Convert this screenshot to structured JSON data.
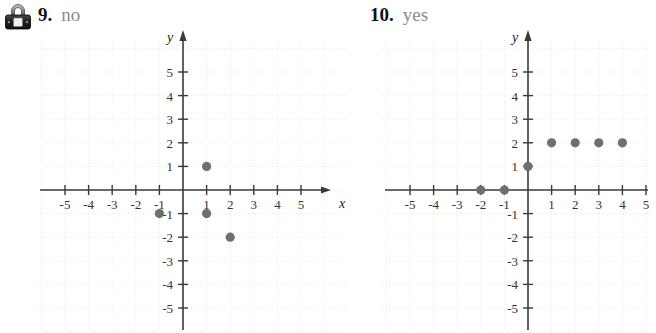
{
  "page": {
    "width": 656,
    "height": 333,
    "background": "#ffffff"
  },
  "lock_icon": {
    "name": "padlock-icon",
    "title": "locked"
  },
  "problems": [
    {
      "number": "9.",
      "answer": "no",
      "answer_color": "#8a8a8a",
      "number_color": "#111111"
    },
    {
      "number": "10.",
      "answer": "yes",
      "answer_color": "#8a8a8a",
      "number_color": "#111111"
    }
  ],
  "chart_data": [
    {
      "type": "scatter",
      "title": "9. no",
      "xlabel": "x",
      "ylabel": "y",
      "xlim": [
        -6,
        6
      ],
      "ylim": [
        -6,
        6
      ],
      "xticks": [
        -5,
        -4,
        -3,
        -2,
        -1,
        1,
        2,
        3,
        4,
        5
      ],
      "yticks": [
        -5,
        -4,
        -3,
        -2,
        -1,
        1,
        2,
        3,
        4,
        5
      ],
      "xtick_labels": [
        "-5",
        "-4",
        "-3",
        "-2",
        "-1",
        "1",
        "2",
        "3",
        "4",
        "5"
      ],
      "ytick_labels": [
        "-5",
        "-4",
        "-3",
        "-2",
        "-1",
        "1",
        "2",
        "3",
        "4",
        "5"
      ],
      "grid": true,
      "legend": "none",
      "point_color": "#6f6f6f",
      "points": [
        {
          "x": 1,
          "y": 1
        },
        {
          "x": -1,
          "y": -1
        },
        {
          "x": 1,
          "y": -1
        },
        {
          "x": 2,
          "y": -2
        }
      ]
    },
    {
      "type": "scatter",
      "title": "10. yes",
      "xlabel": "x",
      "ylabel": "y",
      "xlim": [
        -6,
        6
      ],
      "ylim": [
        -6,
        6
      ],
      "xticks": [
        -5,
        -4,
        -3,
        -2,
        -1,
        1,
        2,
        3,
        4,
        5
      ],
      "yticks": [
        -5,
        -4,
        -3,
        -2,
        -1,
        1,
        2,
        3,
        4,
        5
      ],
      "xtick_labels": [
        "-5",
        "-4",
        "-3",
        "-2",
        "-1",
        "1",
        "2",
        "3",
        "4",
        "5"
      ],
      "ytick_labels": [
        "-5",
        "-4",
        "-3",
        "-2",
        "-1",
        "1",
        "2",
        "3",
        "4",
        "5"
      ],
      "grid": true,
      "legend": "none",
      "point_color": "#6f6f6f",
      "points": [
        {
          "x": -2,
          "y": 0
        },
        {
          "x": -1,
          "y": 0
        },
        {
          "x": 0,
          "y": 1
        },
        {
          "x": 1,
          "y": 2
        },
        {
          "x": 2,
          "y": 2
        },
        {
          "x": 3,
          "y": 2
        },
        {
          "x": 4,
          "y": 2
        }
      ]
    }
  ],
  "axis_names": {
    "x": "x",
    "y": "y"
  }
}
